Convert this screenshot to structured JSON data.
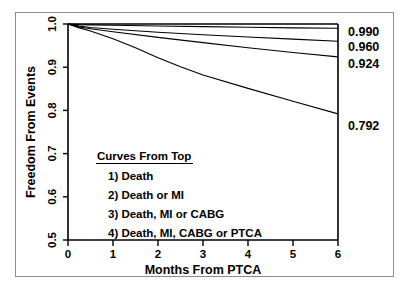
{
  "figure": {
    "background_color": "#ffffff",
    "border_color": "#8d8d8d",
    "ink_color": "#000000"
  },
  "chart_data": {
    "type": "line",
    "title": "",
    "subtitle": "",
    "xlabel": "Months From PTCA",
    "ylabel": "Freedom From Events",
    "xlim": [
      0,
      6
    ],
    "ylim": [
      0.5,
      1.0
    ],
    "xticks": [
      0,
      1,
      2,
      3,
      4,
      5,
      6
    ],
    "xtick_labels": [
      "0",
      "1",
      "2",
      "3",
      "4",
      "5",
      "6"
    ],
    "yticks": [
      0.5,
      0.6,
      0.7,
      0.8,
      0.9,
      1.0
    ],
    "ytick_labels": [
      "0.5",
      "0.6",
      "0.7",
      "0.8",
      "0.9",
      "1.0"
    ],
    "grid": false,
    "legend_position": "inside-center",
    "legend_title": "Curves From Top",
    "legend_entries": [
      "1) Death",
      "2) Death or MI",
      "3) Death, MI or CABG",
      "4) Death, MI, CABG or PTCA"
    ],
    "series": [
      {
        "name": "Death",
        "rank": 1,
        "end_label": "0.990",
        "x": [
          0,
          0.25,
          0.5,
          1,
          2,
          3,
          4,
          5,
          6
        ],
        "values": [
          1.0,
          0.9985,
          0.998,
          0.997,
          0.9955,
          0.994,
          0.9925,
          0.991,
          0.99
        ]
      },
      {
        "name": "Death or MI",
        "rank": 2,
        "end_label": "0.960",
        "x": [
          0,
          0.25,
          0.5,
          1,
          2,
          3,
          4,
          5,
          6
        ],
        "values": [
          1.0,
          0.995,
          0.992,
          0.988,
          0.981,
          0.975,
          0.97,
          0.965,
          0.96
        ]
      },
      {
        "name": "Death, MI or CABG",
        "rank": 3,
        "end_label": "0.924",
        "x": [
          0,
          0.25,
          0.5,
          1,
          2,
          3,
          4,
          5,
          6
        ],
        "values": [
          1.0,
          0.993,
          0.989,
          0.982,
          0.969,
          0.957,
          0.945,
          0.934,
          0.924
        ]
      },
      {
        "name": "Death, MI, CABG or PTCA",
        "rank": 4,
        "end_label": "0.792",
        "x": [
          0,
          0.25,
          0.5,
          1,
          1.5,
          2,
          2.5,
          3,
          4,
          5,
          6
        ],
        "values": [
          1.0,
          0.991,
          0.984,
          0.966,
          0.945,
          0.922,
          0.901,
          0.882,
          0.851,
          0.821,
          0.792
        ]
      }
    ],
    "end_labels": [
      "0.990",
      "0.960",
      "0.924",
      "0.792"
    ]
  }
}
